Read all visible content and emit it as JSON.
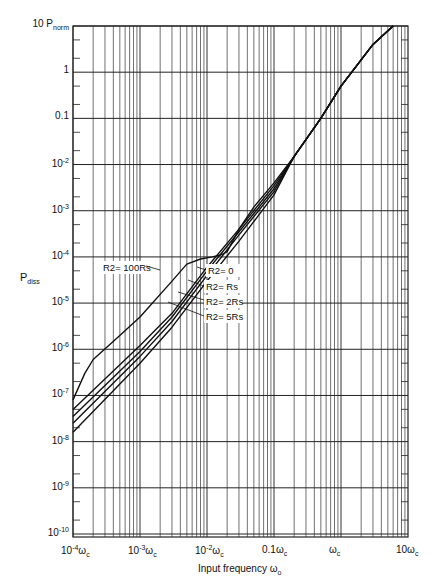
{
  "chart_data": {
    "type": "line",
    "title": "",
    "xlabel": "Input frequency ω0",
    "ylabel": "Pdiss",
    "x_scale": "log",
    "y_scale": "log",
    "xlim": [
      0.0001,
      10
    ],
    "ylim": [
      1e-10,
      10
    ],
    "x_tick_labels": [
      "10^-4 ωc",
      "10^-3 ωc",
      "10^-2 ωc",
      "0.1 ωc",
      "ωc",
      "10 ωc"
    ],
    "x_tick_values": [
      0.0001,
      0.001,
      0.01,
      0.1,
      1,
      10
    ],
    "y_tick_labels": [
      "10 Pnorm",
      "1",
      "0.1",
      "10^-2",
      "10^-3",
      "10^-4",
      "10^-5",
      "10^-6",
      "10^-7",
      "10^-8",
      "10^-9",
      "10^-10"
    ],
    "y_tick_values": [
      10,
      1,
      0.1,
      0.01,
      0.001,
      0.0001,
      1e-05,
      1e-06,
      1e-07,
      1e-08,
      1e-09,
      1e-10
    ],
    "grid": true,
    "legend_position": "annotations",
    "series": [
      {
        "name": "R2 = 100Rs",
        "x": [
          0.0001,
          0.00015,
          0.0002,
          0.0005,
          0.001,
          0.003,
          0.005,
          0.008,
          0.012,
          0.016,
          0.02,
          0.03,
          0.05,
          0.1,
          0.2,
          0.5,
          1,
          3,
          6
        ],
        "y": [
          8e-08,
          3e-07,
          6e-07,
          2e-06,
          5e-06,
          3e-05,
          7e-05,
          9e-05,
          0.0001,
          0.00011,
          0.00013,
          0.0004,
          0.0012,
          0.004,
          0.015,
          0.1,
          0.5,
          4,
          10
        ]
      },
      {
        "name": "R2 = 0",
        "x": [
          0.0001,
          0.001,
          0.003,
          0.01,
          0.03,
          0.1,
          0.2,
          0.5,
          1,
          3,
          6
        ],
        "y": [
          5e-08,
          1.2e-06,
          6e-06,
          6e-05,
          0.0004,
          0.0035,
          0.015,
          0.1,
          0.5,
          4,
          10
        ]
      },
      {
        "name": "R2 = Rs",
        "x": [
          0.0001,
          0.001,
          0.003,
          0.01,
          0.03,
          0.1,
          0.2,
          0.5,
          1,
          3,
          6
        ],
        "y": [
          3.5e-08,
          9e-07,
          5e-06,
          5e-05,
          0.00035,
          0.003,
          0.015,
          0.1,
          0.5,
          4,
          10
        ]
      },
      {
        "name": "R2 = 2Rs",
        "x": [
          0.0001,
          0.001,
          0.003,
          0.01,
          0.03,
          0.1,
          0.2,
          0.5,
          1,
          3,
          6
        ],
        "y": [
          2.5e-08,
          7e-07,
          4e-06,
          4e-05,
          0.0003,
          0.0026,
          0.015,
          0.1,
          0.5,
          4,
          10
        ]
      },
      {
        "name": "R2 = 5Rs",
        "x": [
          0.0001,
          0.001,
          0.003,
          0.01,
          0.03,
          0.1,
          0.2,
          0.5,
          1,
          3,
          6
        ],
        "y": [
          1.6e-08,
          5e-07,
          3e-06,
          3e-05,
          0.00022,
          0.0022,
          0.015,
          0.1,
          0.5,
          4,
          10
        ]
      }
    ],
    "annotations": [
      {
        "text": "R2= 100Rs",
        "x": 0.0025,
        "y": 0.0001
      },
      {
        "text": "R2= 0",
        "x": 0.01,
        "y": 6e-05
      },
      {
        "text": "R2= Rs",
        "x": 0.008,
        "y": 2.7e-05
      },
      {
        "text": "R2= 2Rs",
        "x": 0.005,
        "y": 1.5e-05
      },
      {
        "text": "R2= 5Rs",
        "x": 0.003,
        "y": 8e-06
      }
    ]
  },
  "labels": {
    "ylabel_main": "P",
    "ylabel_sub": "diss",
    "xlabel": "Input frequency ω",
    "xlabel_sub": "o"
  }
}
